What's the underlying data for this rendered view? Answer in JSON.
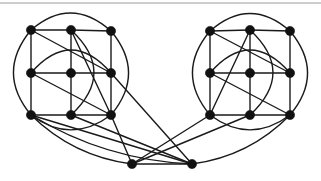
{
  "figure": {
    "caption": "",
    "width": 321,
    "height": 181,
    "background_color": "#ffffff",
    "stroke_color": "#1a1a1a",
    "vertex_color": "#111111",
    "frame_color": "#9a9a9a"
  },
  "chart_data": {
    "type": "diagram",
    "title": "",
    "xlabel": "",
    "ylabel": "",
    "vertex_count": 20,
    "vertex_radius": 4.6,
    "edge_width": 1.4,
    "vertices": [
      {
        "id": "L11",
        "x": 31,
        "y": 30,
        "label": ""
      },
      {
        "id": "L12",
        "x": 71,
        "y": 30,
        "label": ""
      },
      {
        "id": "L13",
        "x": 111,
        "y": 31,
        "label": ""
      },
      {
        "id": "L21",
        "x": 31,
        "y": 73,
        "label": ""
      },
      {
        "id": "L22",
        "x": 71,
        "y": 73,
        "label": ""
      },
      {
        "id": "L23",
        "x": 111,
        "y": 73,
        "label": ""
      },
      {
        "id": "L31",
        "x": 31,
        "y": 115,
        "label": ""
      },
      {
        "id": "L32",
        "x": 71,
        "y": 115,
        "label": ""
      },
      {
        "id": "L33",
        "x": 111,
        "y": 115,
        "label": ""
      },
      {
        "id": "R11",
        "x": 210,
        "y": 31,
        "label": ""
      },
      {
        "id": "R12",
        "x": 250,
        "y": 30,
        "label": ""
      },
      {
        "id": "R13",
        "x": 290,
        "y": 31,
        "label": ""
      },
      {
        "id": "R21",
        "x": 210,
        "y": 73,
        "label": ""
      },
      {
        "id": "R22",
        "x": 250,
        "y": 73,
        "label": ""
      },
      {
        "id": "R23",
        "x": 290,
        "y": 73,
        "label": ""
      },
      {
        "id": "R31",
        "x": 210,
        "y": 115,
        "label": ""
      },
      {
        "id": "R32",
        "x": 250,
        "y": 115,
        "label": ""
      },
      {
        "id": "R33",
        "x": 290,
        "y": 115,
        "label": ""
      },
      {
        "id": "HL",
        "x": 132,
        "y": 164,
        "label": ""
      },
      {
        "id": "HR",
        "x": 192,
        "y": 164,
        "label": ""
      }
    ],
    "straight_edges": [
      [
        "L11",
        "L12"
      ],
      [
        "L12",
        "L13"
      ],
      [
        "L21",
        "L22"
      ],
      [
        "L22",
        "L23"
      ],
      [
        "L31",
        "L32"
      ],
      [
        "L32",
        "L33"
      ],
      [
        "L11",
        "L21"
      ],
      [
        "L21",
        "L31"
      ],
      [
        "L12",
        "L22"
      ],
      [
        "L22",
        "L32"
      ],
      [
        "L13",
        "L23"
      ],
      [
        "L23",
        "L33"
      ],
      [
        "L11",
        "L23"
      ],
      [
        "L21",
        "L33"
      ],
      [
        "L12",
        "L33"
      ],
      [
        "R11",
        "R12"
      ],
      [
        "R12",
        "R13"
      ],
      [
        "R21",
        "R22"
      ],
      [
        "R22",
        "R23"
      ],
      [
        "R31",
        "R32"
      ],
      [
        "R32",
        "R33"
      ],
      [
        "R11",
        "R21"
      ],
      [
        "R21",
        "R31"
      ],
      [
        "R12",
        "R22"
      ],
      [
        "R22",
        "R32"
      ],
      [
        "R13",
        "R23"
      ],
      [
        "R23",
        "R33"
      ],
      [
        "R11",
        "R23"
      ],
      [
        "R21",
        "R33"
      ],
      [
        "R12",
        "R31"
      ],
      [
        "HL",
        "HR"
      ],
      [
        "L31",
        "HR"
      ],
      [
        "L32",
        "HR"
      ],
      [
        "L33",
        "HL"
      ],
      [
        "R31",
        "HL"
      ],
      [
        "R32",
        "HL"
      ],
      [
        "L23",
        "HR"
      ]
    ],
    "arc_edges": [
      {
        "from": "L11",
        "to": "L13",
        "sweep": "over-top",
        "bulge": 26
      },
      {
        "from": "L31",
        "to": "L33",
        "sweep": "under-bottom",
        "bulge": 22
      },
      {
        "from": "L11",
        "to": "L31",
        "sweep": "left-out",
        "bulge": 26
      },
      {
        "from": "L13",
        "to": "L33",
        "sweep": "right-out",
        "bulge": 26
      },
      {
        "from": "L21",
        "to": "L23",
        "sweep": "inner-down",
        "bulge": 34
      },
      {
        "from": "L12",
        "to": "L32",
        "sweep": "inner-right",
        "bulge": 34
      },
      {
        "from": "R11",
        "to": "R13",
        "sweep": "over-top",
        "bulge": 26
      },
      {
        "from": "R31",
        "to": "R33",
        "sweep": "under-bottom",
        "bulge": 22
      },
      {
        "from": "R11",
        "to": "R31",
        "sweep": "left-out",
        "bulge": 26
      },
      {
        "from": "R13",
        "to": "R33",
        "sweep": "right-out",
        "bulge": 26
      },
      {
        "from": "R21",
        "to": "R23",
        "sweep": "inner-down",
        "bulge": 34
      },
      {
        "from": "R12",
        "to": "R32",
        "sweep": "inner-right",
        "bulge": 34
      },
      {
        "from": "L31",
        "to": "HL",
        "sweep": "long-low",
        "bulge": 14
      },
      {
        "from": "L31",
        "to": "HR",
        "sweep": "long-low",
        "bulge": 16
      },
      {
        "from": "R33",
        "to": "HR",
        "sweep": "long-low",
        "bulge": -14
      }
    ],
    "frame_rules": [
      {
        "x1": 0,
        "y1": 3,
        "x2": 321,
        "y2": 3
      }
    ]
  }
}
